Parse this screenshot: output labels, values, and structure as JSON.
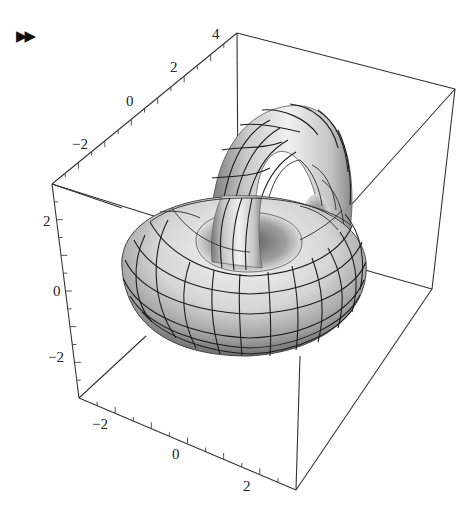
{
  "cell": {
    "prompt_icon": "output-cell-arrow-icon",
    "prompt_glyph": "▶▶"
  },
  "chart_data": {
    "type": "surface3d",
    "title": "",
    "objects": [
      {
        "name": "horizontal torus",
        "orientation": "lying flat (xy-plane)",
        "center": [
          0,
          0,
          0
        ]
      },
      {
        "name": "vertical torus",
        "orientation": "standing upright, passing through the hole of the horizontal torus",
        "center": [
          1,
          0,
          1
        ]
      }
    ],
    "axes": {
      "back_top_axis": {
        "ticks": [
          "4",
          "2",
          "0",
          "−2"
        ],
        "range": [
          -3,
          4
        ]
      },
      "left_vertical_axis": {
        "ticks": [
          "2",
          "0",
          "−2"
        ],
        "range": [
          -3,
          3
        ]
      },
      "front_bottom_axis": {
        "ticks": [
          "−2",
          "0",
          "2"
        ],
        "range": [
          -3,
          3
        ]
      }
    },
    "mesh": true,
    "shading": "grayscale",
    "boxed": true
  },
  "labels": {
    "top": [
      "4",
      "2",
      "0",
      "−2"
    ],
    "left": [
      "2",
      "0",
      "−2"
    ],
    "bottom": [
      "−2",
      "0",
      "2"
    ]
  }
}
